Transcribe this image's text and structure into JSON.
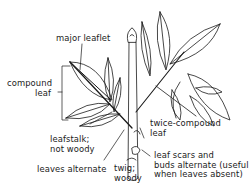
{
  "diagram": {
    "colors": {
      "ink": "#1a1a1a",
      "background": "#ffffff"
    },
    "labels": {
      "major_leaflet": {
        "lines": [
          "major leaflet"
        ]
      },
      "compound_leaf": {
        "lines": [
          "compound",
          "leaf"
        ]
      },
      "leafstalk": {
        "lines": [
          "leafstalk;",
          "not woody"
        ]
      },
      "leaves_alternate": {
        "lines": [
          "leaves alternate"
        ]
      },
      "twig": {
        "lines": [
          "twig;",
          "woody"
        ]
      },
      "twice_compound": {
        "lines": [
          "twice-compound",
          "leaf"
        ]
      },
      "leaf_scars": {
        "lines": [
          "leaf scars and",
          "buds alternate (useful",
          "when leaves absent)"
        ]
      }
    }
  }
}
